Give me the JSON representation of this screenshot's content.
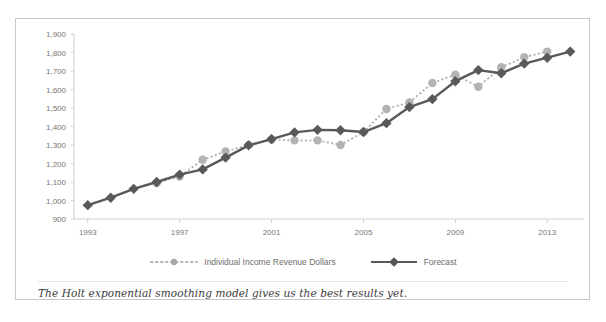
{
  "caption": {
    "text": "The Holt exponential smoothing model gives us the best results yet."
  },
  "colors": {
    "forecast": "#595959",
    "actual": "#b3b3b3",
    "axis": "#d0d0d0",
    "tick_text": "#777777",
    "frame_border": "#c9c9c9",
    "background": "#ffffff",
    "caption_text": "#3b3b3b"
  },
  "legend": {
    "position": "bottom-center",
    "entries": [
      {
        "label": "Individual Income Revenue Dollars",
        "style": "dotted",
        "marker": "circle",
        "color": "#b3b3b3"
      },
      {
        "label": "Forecast",
        "style": "solid",
        "marker": "diamond",
        "color": "#595959"
      }
    ]
  },
  "chart_data": {
    "type": "line",
    "title": "",
    "subtitle": "",
    "xlabel": "",
    "ylabel": "",
    "grid": false,
    "legend_position": "bottom-center",
    "xlim": [
      1992.4,
      2014.6
    ],
    "ylim": [
      900,
      1900
    ],
    "ytick_labels": [
      "1,900",
      "1,800",
      "1,700",
      "1,600",
      "1,500",
      "1,400",
      "1,300",
      "1,200",
      "1,100",
      "1,000",
      "900"
    ],
    "ytick_values": [
      1900,
      1800,
      1700,
      1600,
      1500,
      1400,
      1300,
      1200,
      1100,
      1000,
      900
    ],
    "xtick_labels": [
      "1993",
      "1997",
      "2001",
      "2005",
      "2009",
      "2013"
    ],
    "xtick_values": [
      1993,
      1997,
      2001,
      2005,
      2009,
      2013
    ],
    "x": [
      1993,
      1994,
      1995,
      1996,
      1997,
      1998,
      1999,
      2000,
      2001,
      2002,
      2003,
      2004,
      2005,
      2006,
      2007,
      2008,
      2009,
      2010,
      2011,
      2012,
      2013,
      2014
    ],
    "series": [
      {
        "name": "Individual Income Revenue Dollars",
        "marker": "circle",
        "style": "dotted",
        "color": "#b3b3b3",
        "x": [
          1996,
          1997,
          1998,
          1999,
          2000,
          2001,
          2002,
          2003,
          2004,
          2005,
          2006,
          2007,
          2008,
          2009,
          2010,
          2011,
          2012,
          2013
        ],
        "values": [
          1095,
          1130,
          1220,
          1265,
          1300,
          1330,
          1325,
          1325,
          1300,
          1370,
          1495,
          1530,
          1635,
          1680,
          1615,
          1720,
          1775,
          1805
        ]
      },
      {
        "name": "Forecast",
        "marker": "diamond",
        "style": "solid",
        "color": "#595959",
        "x": [
          1993,
          1994,
          1995,
          1996,
          1997,
          1998,
          1999,
          2000,
          2001,
          2002,
          2003,
          2004,
          2005,
          2006,
          2007,
          2008,
          2009,
          2010,
          2011,
          2012,
          2013,
          2014
        ],
        "values": [
          975,
          1015,
          1063,
          1100,
          1140,
          1168,
          1232,
          1298,
          1332,
          1368,
          1382,
          1380,
          1370,
          1418,
          1505,
          1548,
          1645,
          1705,
          1688,
          1740,
          1772,
          1805
        ]
      }
    ]
  }
}
